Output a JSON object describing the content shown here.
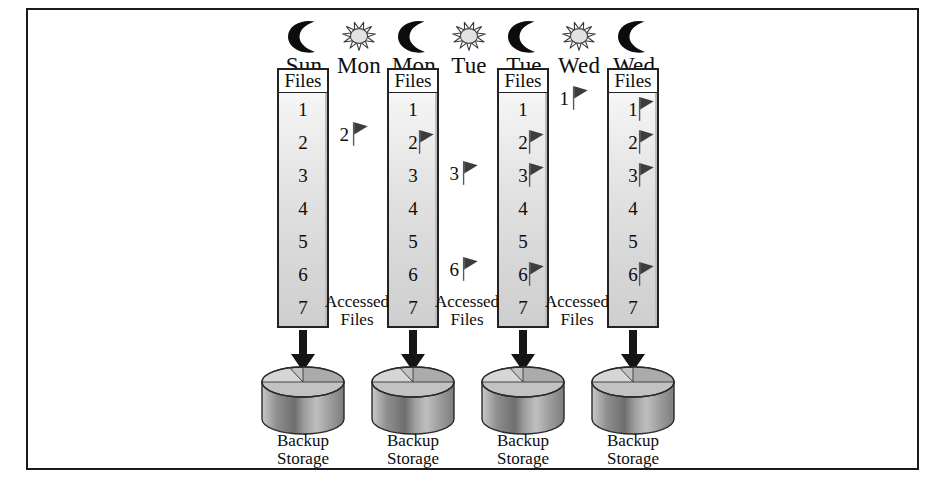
{
  "diagram": {
    "border_color": "#1b1b1b",
    "background": "#ffffff",
    "flag_color": "#3a3a3a",
    "arrow_color": "#151515",
    "header_labels": [
      {
        "id": "sun-night",
        "day": "Sun",
        "icon": "moon-icon"
      },
      {
        "id": "mon-day",
        "day": "Mon",
        "icon": "sun-icon"
      },
      {
        "id": "mon-night",
        "day": "Mon",
        "icon": "moon-icon"
      },
      {
        "id": "tue-day",
        "day": "Tue",
        "icon": "sun-icon"
      },
      {
        "id": "tue-night",
        "day": "Tue",
        "icon": "moon-icon"
      },
      {
        "id": "wed-day",
        "day": "Wed",
        "icon": "sun-icon"
      },
      {
        "id": "wed-night",
        "day": "Wed",
        "icon": "moon-icon"
      }
    ],
    "files_header": "Files",
    "file_numbers": [
      "1",
      "2",
      "3",
      "4",
      "5",
      "6",
      "7"
    ],
    "backup_label_line1": "Backup",
    "backup_label_line2": "Storage",
    "accessed_label_line1": "Accessed",
    "accessed_label_line2": "Files",
    "columns": [
      {
        "id": "col-sun-night",
        "day": "Sun",
        "flagged_files": []
      },
      {
        "id": "col-mon-night",
        "day": "Mon",
        "flagged_files": [
          "2"
        ]
      },
      {
        "id": "col-tue-night",
        "day": "Tue",
        "flagged_files": [
          "2",
          "3",
          "6"
        ]
      },
      {
        "id": "col-wed-night",
        "day": "Wed",
        "flagged_files": [
          "1",
          "2",
          "3",
          "6"
        ]
      }
    ],
    "accessed_columns": [
      {
        "id": "acc-mon",
        "day": "Mon",
        "files": [
          "2"
        ]
      },
      {
        "id": "acc-tue",
        "day": "Tue",
        "files": [
          "3",
          "6"
        ]
      },
      {
        "id": "acc-wed",
        "day": "Wed",
        "files": [
          "1"
        ]
      }
    ],
    "backups": [
      {
        "id": "backup-sun",
        "day": "Sun"
      },
      {
        "id": "backup-mon",
        "day": "Mon"
      },
      {
        "id": "backup-tue",
        "day": "Tue"
      },
      {
        "id": "backup-wed",
        "day": "Wed"
      }
    ]
  }
}
